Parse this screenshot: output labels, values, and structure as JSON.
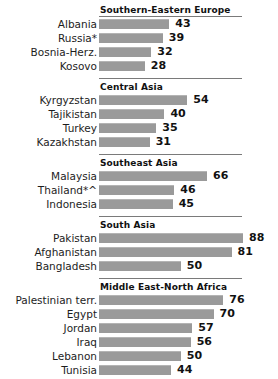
{
  "chart_data": {
    "type": "bar",
    "title": "",
    "xlabel": "",
    "ylabel": "",
    "orientation": "horizontal",
    "xlim": [
      0,
      88
    ],
    "grid": false,
    "legend": null,
    "bar_color": "#9a9a9a",
    "value_label_position": "outside-end",
    "groups": [
      {
        "name": "Southern-Eastern  Europe",
        "categories": [
          "Albania",
          "Russia*",
          "Bosnia-Herz.",
          "Kosovo"
        ],
        "values": [
          43,
          39,
          32,
          28
        ]
      },
      {
        "name": "Central Asia",
        "categories": [
          "Kyrgyzstan",
          "Tajikistan",
          "Turkey",
          "Kazakhstan"
        ],
        "values": [
          54,
          40,
          35,
          31
        ]
      },
      {
        "name": "Southeast  Asia",
        "categories": [
          "Malaysia",
          "Thailand*^",
          "Indonesia"
        ],
        "values": [
          66,
          46,
          45
        ]
      },
      {
        "name": "South  Asia",
        "categories": [
          "Pakistan",
          "Afghanistan",
          "Bangladesh"
        ],
        "values": [
          88,
          81,
          50
        ]
      },
      {
        "name": "Middle East-North  Africa",
        "categories": [
          "Palestinian terr.",
          "Egypt",
          "Jordan",
          "Iraq",
          "Lebanon",
          "Tunisia"
        ],
        "values": [
          76,
          70,
          57,
          56,
          50,
          44
        ]
      }
    ],
    "categories": [
      "Albania",
      "Russia*",
      "Bosnia-Herz.",
      "Kosovo",
      "Kyrgyzstan",
      "Tajikistan",
      "Turkey",
      "Kazakhstan",
      "Malaysia",
      "Thailand*^",
      "Indonesia",
      "Pakistan",
      "Afghanistan",
      "Bangladesh",
      "Palestinian terr.",
      "Egypt",
      "Jordan",
      "Iraq",
      "Lebanon",
      "Tunisia"
    ],
    "values": [
      43,
      39,
      32,
      28,
      54,
      40,
      35,
      31,
      66,
      46,
      45,
      88,
      81,
      50,
      76,
      70,
      57,
      56,
      50,
      44
    ]
  }
}
